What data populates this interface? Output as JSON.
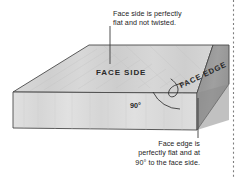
{
  "figure": {
    "background_color": "#ffffff",
    "callouts": {
      "top": "Face side is perfectly\nflat and not twisted.",
      "bottom": "Face edge is\nperfectly flat and at\n90° to the face side."
    },
    "labels": {
      "face_side": "FACE SIDE",
      "face_edge": "FACE EDGE",
      "angle": "90°"
    },
    "colors": {
      "top_face": "#d4d4d4",
      "front_face": "#dcdcdc",
      "end_face": "#9b9b9b",
      "outline": "#4a4a4a",
      "leader_line": "#3c3c3c",
      "text": "#1c1c1c",
      "dotted_rule": "#8a8a8a"
    }
  }
}
